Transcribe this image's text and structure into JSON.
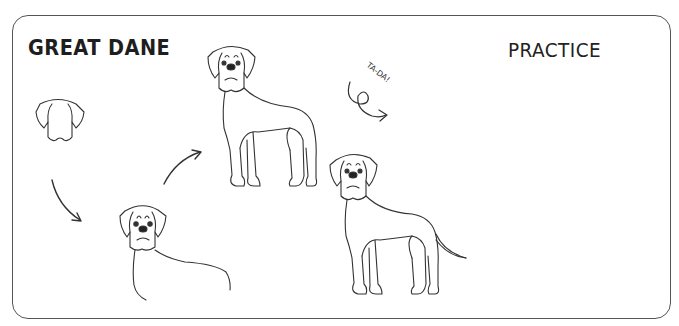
{
  "worksheet": {
    "title": "GREAT DANE",
    "practice_label": "PRACTICE",
    "exclamation": "TA-DA!",
    "steps": [
      {
        "step": 1,
        "description": "head outline"
      },
      {
        "step": 2,
        "description": "head with face and neck/back line"
      },
      {
        "step": 3,
        "description": "full body standing"
      },
      {
        "step": 4,
        "description": "finished dog with tail"
      }
    ]
  },
  "colors": {
    "ink": "#333333",
    "frame": "#555555",
    "background": "#ffffff"
  }
}
